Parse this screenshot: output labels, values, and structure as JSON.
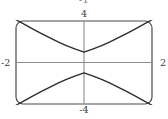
{
  "figure": {
    "clipped_top_label": "-1",
    "frame": {
      "rounded": true,
      "stroke": "#4a4a4a"
    },
    "axis_color": "#8c8c8c",
    "curve_color": "#2b2b2b"
  },
  "labels": {
    "top": "4",
    "bottom": "-4",
    "left": "-2",
    "right": "2"
  },
  "chart_data": {
    "type": "line",
    "title": "",
    "subtitle": "",
    "xlabel": "",
    "ylabel": "",
    "xlim": [
      -2,
      2
    ],
    "ylim": [
      -4,
      4
    ],
    "xticks": [
      -2,
      2
    ],
    "xticklabels": [
      "-2",
      "2"
    ],
    "yticks": [
      -4,
      4
    ],
    "yticklabels": [
      "-4",
      "4"
    ],
    "grid": false,
    "legend": false,
    "legend_position": "none",
    "annotations": [
      "-1"
    ],
    "series": [
      {
        "name": "upper-branch",
        "x": [
          -2.0,
          -1.75,
          -1.5,
          -1.25,
          -1.0,
          -0.75,
          -0.5,
          -0.25,
          0.0,
          0.25,
          0.5,
          0.75,
          1.0,
          1.25,
          1.5,
          1.75,
          2.0
        ],
        "y": [
          4.12,
          3.67,
          3.22,
          2.79,
          2.37,
          1.97,
          1.6,
          1.28,
          1.0,
          1.28,
          1.6,
          1.97,
          2.37,
          2.79,
          3.22,
          3.67,
          4.12
        ]
      },
      {
        "name": "lower-branch",
        "x": [
          -2.0,
          -1.75,
          -1.5,
          -1.25,
          -1.0,
          -0.75,
          -0.5,
          -0.25,
          0.0,
          0.25,
          0.5,
          0.75,
          1.0,
          1.25,
          1.5,
          1.75,
          2.0
        ],
        "y": [
          -4.12,
          -3.67,
          -3.22,
          -2.79,
          -2.37,
          -1.97,
          -1.6,
          -1.28,
          -1.0,
          -1.28,
          -1.6,
          -1.97,
          -2.37,
          -2.79,
          -3.22,
          -3.67,
          -4.12
        ]
      }
    ]
  }
}
